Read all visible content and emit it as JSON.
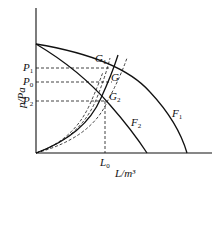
{
  "diagram": {
    "type": "fan-system characteristic curves",
    "y_axis_label": "p/Pa",
    "x_axis_label": "L/m³",
    "y_ticks": [
      {
        "name": "P",
        "sub": "1"
      },
      {
        "name": "P",
        "sub": "0"
      },
      {
        "name": "P",
        "sub": "2"
      }
    ],
    "x_ticks": [
      {
        "name": "L",
        "sub": "0"
      }
    ],
    "curves": [
      {
        "name": "F",
        "sub": "1"
      },
      {
        "name": "F",
        "sub": "2"
      }
    ],
    "points": [
      {
        "name": "G",
        "sub": "1"
      },
      {
        "name": "G",
        "sub": ""
      },
      {
        "name": "G",
        "sub": "2"
      }
    ],
    "colors": {
      "line": "#111111",
      "background": "#ffffff"
    }
  }
}
